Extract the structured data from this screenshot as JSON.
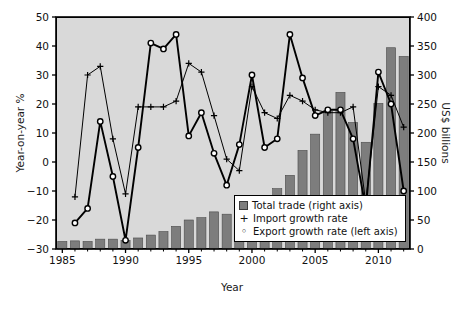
{
  "chart_data": {
    "type": "bar",
    "title": "",
    "xlabel": "Year",
    "ylabel": "Year-on-year %",
    "ylabel_right": "US$ billions",
    "xlim": [
      1984.5,
      2012.5
    ],
    "ylim": [
      -30,
      50
    ],
    "ylim_right": [
      0,
      400
    ],
    "grid": false,
    "legend_position": "bottom-right",
    "x_ticks": [
      1985,
      1990,
      1995,
      2000,
      2005,
      2010
    ],
    "y_ticks_left": [
      -30,
      -20,
      -10,
      0,
      10,
      20,
      30,
      40,
      50
    ],
    "y_ticks_right": [
      0,
      50,
      100,
      150,
      200,
      250,
      300,
      350,
      400
    ],
    "categories": [
      1985,
      1986,
      1987,
      1988,
      1989,
      1990,
      1991,
      1992,
      1993,
      1994,
      1995,
      1996,
      1997,
      1998,
      1999,
      2000,
      2001,
      2002,
      2003,
      2004,
      2005,
      2006,
      2007,
      2008,
      2009,
      2010,
      2011,
      2012
    ],
    "series": [
      {
        "name": "Total trade (right axis)",
        "type": "bar",
        "axis": "right",
        "unit": "US$ billions",
        "color": "#7d7d7d",
        "values": [
          13,
          14,
          13,
          17,
          17,
          15,
          19,
          24,
          30,
          39,
          50,
          54,
          64,
          60,
          67,
          85,
          88,
          104,
          127,
          170,
          198,
          238,
          270,
          218,
          184,
          251,
          347,
          332
        ]
      },
      {
        "name": "Import growth rate",
        "type": "line",
        "axis": "left",
        "unit": "%",
        "marker": "plus",
        "color": "#000000",
        "values": [
          null,
          -12,
          30,
          33,
          8,
          -11,
          19,
          19,
          19,
          21,
          34,
          31,
          16,
          1,
          -3,
          26,
          17,
          15,
          23,
          21,
          18,
          17,
          17,
          19,
          -14,
          26,
          23,
          12
        ]
      },
      {
        "name": "Export growth rate (left axis)",
        "type": "line",
        "axis": "left",
        "unit": "%",
        "marker": "circle",
        "color": "#000000",
        "values": [
          null,
          -21,
          -16,
          14,
          -5,
          -27,
          5,
          41,
          39,
          44,
          9,
          17,
          3,
          -8,
          6,
          30,
          5,
          8,
          44,
          29,
          16,
          18,
          18,
          8,
          -16,
          31,
          20,
          -10
        ]
      }
    ],
    "legend": [
      {
        "label": "Total trade (right axis)",
        "marker": "square"
      },
      {
        "label": "Import growth rate",
        "marker": "plus"
      },
      {
        "label": "Export growth rate (left axis)",
        "marker": "circle"
      }
    ]
  }
}
